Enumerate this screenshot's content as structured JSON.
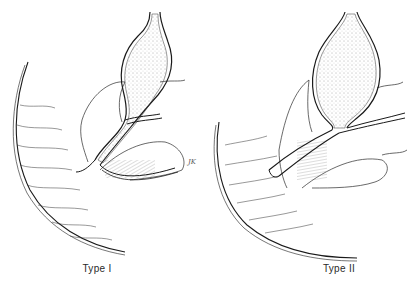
{
  "figure": {
    "panels": [
      {
        "id": "type-1",
        "label": "Type I",
        "description": "Choledochal cyst illustration — fusiform dilatation of the common bile duct above its junction with the pancreatic duct; long common channel near duodenum",
        "signature": "JK"
      },
      {
        "id": "type-2",
        "label": "Type II",
        "description": "Choledochal cyst illustration — larger saccular dilatation with pancreatic duct joining the bile duct at an angle; duodenal curve shown at lower left"
      }
    ],
    "colors": {
      "ink": "#1a1a1a",
      "stipple": "#6a6a6a",
      "background": "#ffffff"
    }
  }
}
